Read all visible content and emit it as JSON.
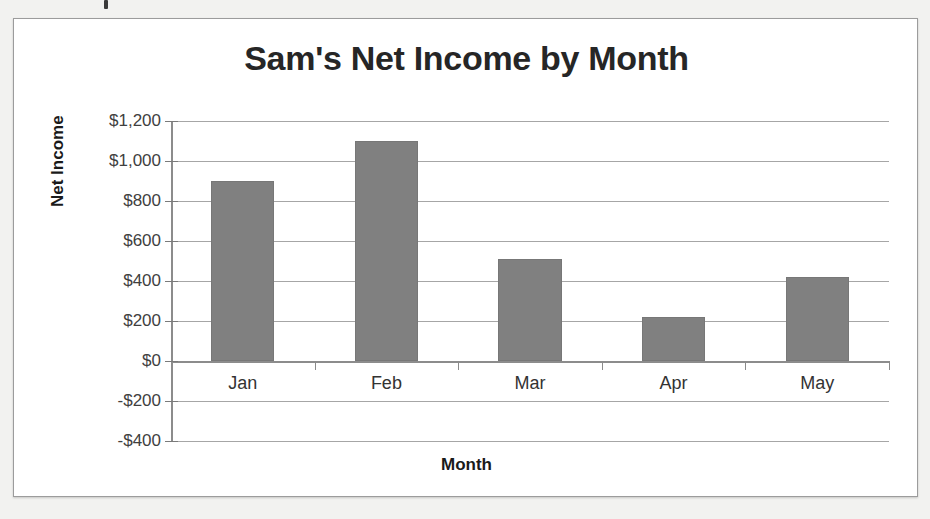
{
  "chart_data": {
    "type": "bar",
    "title": "Sam's Net Income by Month",
    "xlabel": "Month",
    "ylabel": "Net Income",
    "categories": [
      "Jan",
      "Feb",
      "Mar",
      "Apr",
      "May"
    ],
    "values": [
      900,
      1100,
      510,
      220,
      420
    ],
    "ylim": [
      -400,
      1200
    ],
    "ytick_step": 200,
    "ytick_labels": [
      "$1,200",
      "$1,000",
      "$800",
      "$600",
      "$400",
      "$200",
      "$0",
      "-$200",
      "-$400"
    ],
    "ytick_values": [
      1200,
      1000,
      800,
      600,
      400,
      200,
      0,
      -200,
      -400
    ],
    "grid": true,
    "legend": false,
    "series": [
      {
        "name": "Net Income",
        "values": [
          900,
          1100,
          510,
          220,
          420
        ],
        "color": "#808080"
      }
    ]
  },
  "colors": {
    "bar_fill": "#808080",
    "gridline": "#a6a6a6",
    "axis": "#8c8c8c",
    "frame_border": "#9c9c9c",
    "page_background": "#f2f2f0",
    "plot_background": "#ffffff"
  }
}
